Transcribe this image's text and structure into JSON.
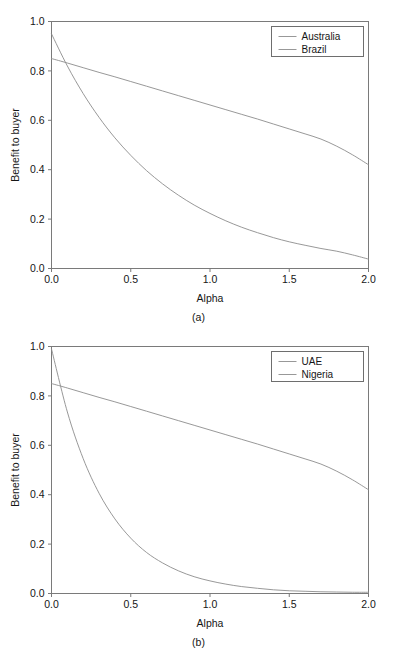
{
  "figure": {
    "panels": [
      {
        "caption": "(a)",
        "chart_data": {
          "type": "line",
          "title": "",
          "xlabel": "Alpha",
          "ylabel": "Benefit to buyer",
          "xlim": [
            0.0,
            2.0
          ],
          "ylim": [
            0.0,
            1.0
          ],
          "xticks": [
            "0.0",
            "0.5",
            "1.0",
            "1.5",
            "2.0"
          ],
          "xtick_values": [
            0.0,
            0.5,
            1.0,
            1.5,
            2.0
          ],
          "yticks": [
            "0.0",
            "0.2",
            "0.4",
            "0.6",
            "0.8",
            "1.0"
          ],
          "ytick_values": [
            0.0,
            0.2,
            0.4,
            0.6,
            0.8,
            1.0
          ],
          "grid": false,
          "legend_position": "top-right",
          "x": [
            0.0,
            0.1,
            0.2,
            0.3,
            0.4,
            0.5,
            0.6,
            0.7,
            0.8,
            0.9,
            1.0,
            1.1,
            1.2,
            1.3,
            1.4,
            1.5,
            1.6,
            1.7,
            1.8,
            1.9,
            2.0
          ],
          "series": [
            {
              "name": "Australia",
              "color": "#8c8c8c",
              "values": [
                0.85,
                0.832,
                0.813,
                0.794,
                0.776,
                0.757,
                0.738,
                0.719,
                0.7,
                0.681,
                0.662,
                0.643,
                0.624,
                0.605,
                0.585,
                0.565,
                0.545,
                0.524,
                0.495,
                0.46,
                0.42
              ]
            },
            {
              "name": "Brazil",
              "color": "#8c8c8c",
              "values": [
                0.95,
                0.82,
                0.708,
                0.612,
                0.529,
                0.458,
                0.396,
                0.343,
                0.297,
                0.257,
                0.223,
                0.193,
                0.167,
                0.145,
                0.125,
                0.108,
                0.094,
                0.081,
                0.07,
                0.055,
                0.038
              ]
            }
          ]
        }
      },
      {
        "caption": "(b)",
        "chart_data": {
          "type": "line",
          "title": "",
          "xlabel": "Alpha",
          "ylabel": "Benefit to buyer",
          "xlim": [
            0.0,
            2.0
          ],
          "ylim": [
            0.0,
            1.0
          ],
          "xticks": [
            "0.0",
            "0.5",
            "1.0",
            "1.5",
            "2.0"
          ],
          "xtick_values": [
            0.0,
            0.5,
            1.0,
            1.5,
            2.0
          ],
          "yticks": [
            "0.0",
            "0.2",
            "0.4",
            "0.6",
            "0.8",
            "1.0"
          ],
          "ytick_values": [
            0.0,
            0.2,
            0.4,
            0.6,
            0.8,
            1.0
          ],
          "grid": false,
          "legend_position": "top-right",
          "x": [
            0.0,
            0.1,
            0.2,
            0.3,
            0.4,
            0.5,
            0.6,
            0.7,
            0.8,
            0.9,
            1.0,
            1.1,
            1.2,
            1.3,
            1.4,
            1.5,
            1.6,
            1.7,
            1.8,
            1.9,
            2.0
          ],
          "series": [
            {
              "name": "UAE",
              "color": "#8c8c8c",
              "values": [
                0.85,
                0.832,
                0.813,
                0.794,
                0.776,
                0.757,
                0.738,
                0.719,
                0.7,
                0.681,
                0.662,
                0.643,
                0.624,
                0.605,
                0.585,
                0.565,
                0.545,
                0.524,
                0.495,
                0.46,
                0.42
              ]
            },
            {
              "name": "Nigeria",
              "color": "#8c8c8c",
              "values": [
                0.99,
                0.735,
                0.546,
                0.406,
                0.302,
                0.224,
                0.166,
                0.124,
                0.092,
                0.068,
                0.051,
                0.038,
                0.028,
                0.021,
                0.015,
                0.011,
                0.009,
                0.007,
                0.006,
                0.005,
                0.005
              ]
            }
          ]
        }
      }
    ]
  }
}
